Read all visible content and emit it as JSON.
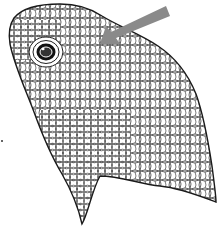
{
  "figure": {
    "caption": "",
    "arrow": {
      "color": "#8a8a8a",
      "label": ""
    },
    "colors": {
      "outline": "#1a1a1a",
      "background": "#ffffff",
      "eye": "#111111"
    }
  }
}
